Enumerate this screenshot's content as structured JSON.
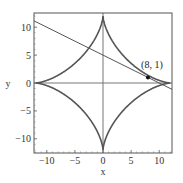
{
  "chart_data": {
    "type": "line",
    "title": "",
    "xlabel": "x",
    "ylabel": "y",
    "xlim": [
      -12.3,
      12.3
    ],
    "ylim": [
      -12.5,
      12.5
    ],
    "grid": false,
    "x_ticks": [
      -10,
      -5,
      0,
      5,
      10
    ],
    "y_ticks": [
      -10,
      -5,
      0,
      5,
      10
    ],
    "x_tick_labels": [
      "−10",
      "−5",
      "0",
      "5",
      "10"
    ],
    "y_tick_labels": [
      "−10",
      "−5",
      "0",
      "5",
      "10"
    ],
    "series": [
      {
        "name": "astroid",
        "equation": "x^(2/3) + y^(2/3) = a^(2/3)",
        "a": 12,
        "color": "#555555"
      },
      {
        "name": "tangent line",
        "equation": "y = 5 - x/2",
        "x": [
          -12.3,
          12.3
        ],
        "y": [
          11.15,
          -1.15
        ],
        "color": "#555555"
      }
    ],
    "points": [
      {
        "x": 8,
        "y": 1,
        "label": "(8, 1)"
      }
    ],
    "annotations": [
      {
        "text": "(8, 1)",
        "x": 8,
        "y": 1
      }
    ]
  }
}
